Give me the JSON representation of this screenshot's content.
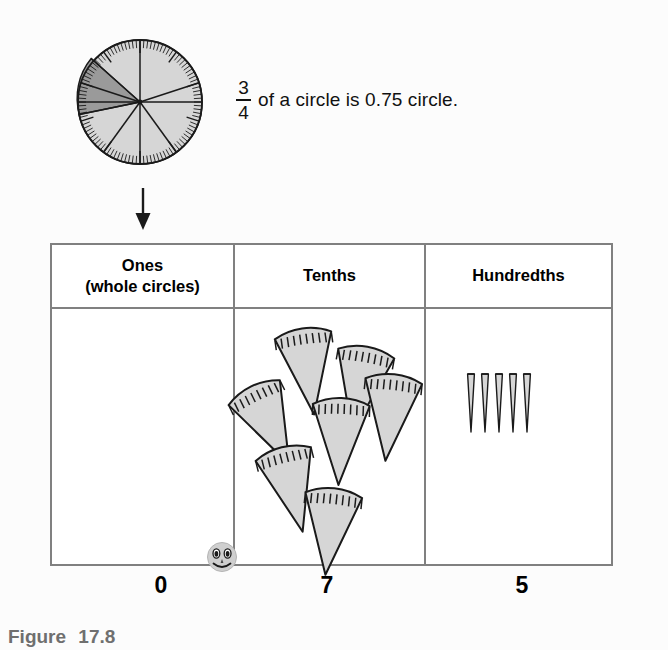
{
  "figure": {
    "caption_label": "Figure",
    "caption_number": "17.8",
    "background_color": "#fcfcfc"
  },
  "circle_statement": {
    "fraction_numerator": "3",
    "fraction_denominator": "4",
    "text": "of a circle is 0.75 circle.",
    "full_text": "3/4 of a circle is 0.75 circle.",
    "circle_sectors": 10,
    "shaded_sectors": 2,
    "shaded_color": "#9a9a9a",
    "unshaded_color": "#d6d6d6",
    "outline_color": "#1a1a1a"
  },
  "arrow": {
    "direction": "down",
    "color": "#1a1a1a"
  },
  "table": {
    "border_color": "#808080",
    "columns": [
      {
        "key": "ones",
        "header_line1": "Ones",
        "header_line2": "(whole circles)",
        "digit": "0",
        "piece_count": 0,
        "piece_type": "whole-circle"
      },
      {
        "key": "tenths",
        "header_line1": "Tenths",
        "header_line2": "",
        "digit": "7",
        "piece_count": 7,
        "piece_type": "wedge"
      },
      {
        "key": "hundredths",
        "header_line1": "Hundredths",
        "header_line2": "",
        "digit": "5",
        "piece_count": 5,
        "piece_type": "sliver"
      }
    ]
  },
  "decimal_point": {
    "marker": "smiley-face",
    "value_represented": "0.75",
    "face_color": "#cfcfcf"
  },
  "tenths_pieces": [
    {
      "x": 42,
      "y": 16,
      "rot": -8
    },
    {
      "x": 94,
      "y": 34,
      "rot": 10
    },
    {
      "x": 4,
      "y": 70,
      "rot": -26
    },
    {
      "x": 74,
      "y": 86,
      "rot": 2
    },
    {
      "x": 124,
      "y": 62,
      "rot": 6
    },
    {
      "x": 26,
      "y": 134,
      "rot": -14
    },
    {
      "x": 64,
      "y": 176,
      "rot": 6
    }
  ],
  "hundredths_pieces": [
    {
      "x": 10,
      "y": 0
    },
    {
      "x": 24,
      "y": 0
    },
    {
      "x": 38,
      "y": 0
    },
    {
      "x": 52,
      "y": 0
    },
    {
      "x": 66,
      "y": 0
    }
  ]
}
